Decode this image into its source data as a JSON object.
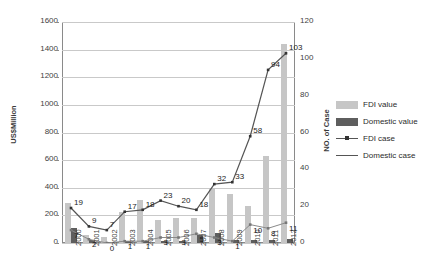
{
  "chart_data": {
    "type": "bar",
    "title": "",
    "subtitle": "",
    "xlabel": "",
    "ylabel": "US$Million",
    "y2label": "NO. of Case",
    "grid": true,
    "legend_position": "right",
    "categories": [
      "2000",
      "2001",
      "2002",
      "2003",
      "2004",
      "2005",
      "2006",
      "2007",
      "2008",
      "2009",
      "2010",
      "2011",
      "2012"
    ],
    "ylim": [
      0,
      1600
    ],
    "yticks": [
      0,
      200,
      400,
      600,
      800,
      1000,
      1200,
      1400,
      1600
    ],
    "y2lim": [
      0,
      120
    ],
    "y2ticks": [
      0,
      20,
      40,
      60,
      80,
      100,
      120
    ],
    "series": [
      {
        "name": "FDI value",
        "type": "bar",
        "axis": "left",
        "color": "#c6c6c6",
        "values": [
          290,
          60,
          40,
          225,
          310,
          170,
          180,
          180,
          395,
          355,
          270,
          630,
          1440
        ]
      },
      {
        "name": "Domestic value",
        "type": "bar",
        "axis": "left",
        "color": "#5e5e5e",
        "values": [
          110,
          20,
          10,
          15,
          15,
          15,
          15,
          60,
          70,
          25,
          20,
          25,
          30
        ]
      },
      {
        "name": "FDI case",
        "type": "line",
        "axis": "right",
        "color": "#555555",
        "values": [
          19,
          9,
          7,
          17,
          18,
          23,
          20,
          18,
          32,
          33,
          58,
          94,
          103
        ],
        "labels": [
          "19",
          "9",
          "7",
          "17",
          "18",
          "23",
          "20",
          "18",
          "32",
          "33",
          "58",
          "94",
          "103"
        ]
      },
      {
        "name": "Domestic case",
        "type": "line",
        "axis": "right",
        "color": "#8a8a8a",
        "values": [
          7,
          2,
          0,
          1,
          1,
          3,
          3,
          5,
          3,
          1,
          10,
          8,
          11
        ],
        "labels": [
          "7",
          "2",
          "0",
          "1",
          "1",
          "3",
          "3",
          "5",
          "3",
          "1",
          "10",
          "8",
          "11"
        ]
      }
    ],
    "legend": [
      {
        "label": "FDI value",
        "key": "swatch-light"
      },
      {
        "label": "Domestic value",
        "key": "swatch-dark"
      },
      {
        "label": "FDI case",
        "key": "line-marker"
      },
      {
        "label": "Domestic case",
        "key": "line-plain"
      }
    ]
  }
}
